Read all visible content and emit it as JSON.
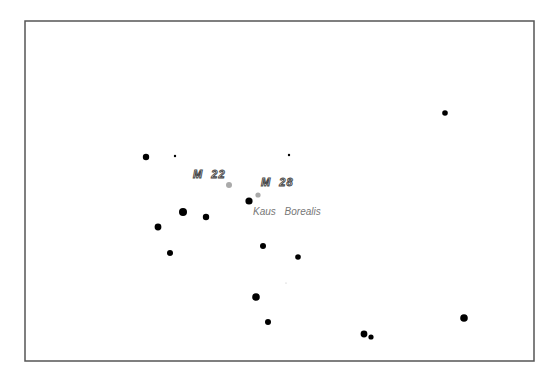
{
  "map": {
    "frame": {
      "x": 25,
      "y": 21,
      "width": 509,
      "height": 340,
      "stroke": "#555555"
    },
    "stars": [
      {
        "x": 445,
        "y": 113,
        "r": 2.8
      },
      {
        "x": 146,
        "y": 157,
        "r": 3.2
      },
      {
        "x": 175,
        "y": 156,
        "r": 1.2
      },
      {
        "x": 289,
        "y": 155,
        "r": 1.2
      },
      {
        "x": 249,
        "y": 201,
        "r": 3.6
      },
      {
        "x": 183,
        "y": 212,
        "r": 4.0
      },
      {
        "x": 206,
        "y": 217,
        "r": 3.2
      },
      {
        "x": 158,
        "y": 227,
        "r": 3.4
      },
      {
        "x": 170,
        "y": 253,
        "r": 3.0
      },
      {
        "x": 263,
        "y": 246,
        "r": 3.0
      },
      {
        "x": 298,
        "y": 257,
        "r": 2.8
      },
      {
        "x": 256,
        "y": 297,
        "r": 3.8
      },
      {
        "x": 268,
        "y": 322,
        "r": 3.0
      },
      {
        "x": 364,
        "y": 334,
        "r": 3.4
      },
      {
        "x": 371,
        "y": 337,
        "r": 2.6
      },
      {
        "x": 464,
        "y": 318,
        "r": 3.8
      },
      {
        "x": 286,
        "y": 283,
        "r": 0.6,
        "color": "#bbbbbb"
      }
    ],
    "deep_sky_objects": [
      {
        "name": "M 22",
        "x": 229,
        "y": 185,
        "r": 3.0,
        "label_x": 193,
        "label_y": 178
      },
      {
        "name": "M 28",
        "x": 258,
        "y": 195,
        "r": 2.6,
        "label_x": 261,
        "label_y": 186
      }
    ],
    "labels": [
      {
        "text": "Kaus Borealis",
        "x": 253,
        "y": 215
      }
    ],
    "colors": {
      "star": "#000000",
      "dso": "#aaaaaa",
      "label_text": "#777777",
      "dso_label_fill": "#ffffff",
      "dso_label_stroke": "#444444"
    }
  }
}
